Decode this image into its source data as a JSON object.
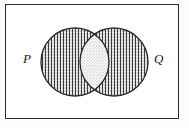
{
  "figure": {
    "background_color": "#fdfdfd",
    "stroke_color": "#2b2b2b"
  },
  "universe": {
    "name": "universal-set-rectangle",
    "x": 5,
    "y": 4,
    "width": 174,
    "height": 115,
    "border_color": "#2b2b2b",
    "border_width": 1.4,
    "fill": "#ffffff"
  },
  "sets": [
    {
      "id": "P",
      "label": "P",
      "label_x": 23,
      "label_y": 52,
      "circle": {
        "cx": 75,
        "cy": 62,
        "r": 34
      },
      "fill_pattern": "vertical-lines-with-dots",
      "stroke_color": "#2b2b2b",
      "stroke_width": 1.3
    },
    {
      "id": "Q",
      "label": "Q",
      "label_x": 154,
      "label_y": 52,
      "circle": {
        "cx": 114,
        "cy": 62,
        "r": 34
      },
      "fill_pattern": "vertical-lines-with-dots",
      "stroke_color": "#2b2b2b",
      "stroke_width": 1.3
    }
  ],
  "intersection": {
    "name": "intersection-lens",
    "label": "",
    "fill_pattern": "sparse-dots",
    "x_range": [
      81,
      108
    ],
    "description": "Overlap of P and Q rendered with a lighter dotted fill"
  },
  "patterns": {
    "vertical_line_spacing": 3,
    "vertical_line_color": "#3a3a3a",
    "dot_color": "#5a5a5a",
    "lens_dot_color": "#8c8c8c",
    "lens_fill": "#fbfbfb",
    "circle_fill": "#f2f2f2"
  }
}
